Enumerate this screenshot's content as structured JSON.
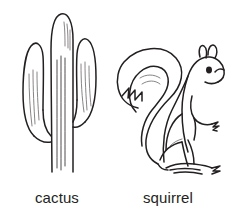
{
  "page": {
    "background_color": "#ffffff",
    "ink_color": "#231f20",
    "width": 228,
    "height": 214,
    "style": "black-and-white line drawing flashcard"
  },
  "items": [
    {
      "id": "cactus",
      "label": "cactus",
      "illustration_name": "saguaro-cactus-drawing",
      "description": "Tall saguaro cactus with a central column and two upward-curving arms, shaded with fine vertical hatching"
    },
    {
      "id": "squirrel",
      "label": "squirrel",
      "illustration_name": "squirrel-drawing",
      "description": "Squirrel seated upright in profile facing right, with a large bushy tail curving up and over its back"
    }
  ]
}
